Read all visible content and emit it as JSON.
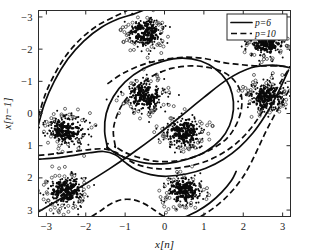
{
  "figure": {
    "background": "#ffffff",
    "point_color": "#0a0a0a",
    "line_color": "#0d0d0d"
  },
  "axes": {
    "xlabel": "x[n]",
    "ylabel": "x[n−1]",
    "xlim": [
      -3.2,
      3.2
    ],
    "ylim": [
      -3.2,
      3.2
    ],
    "xticks": [
      -3,
      -2,
      -1,
      0,
      1,
      2,
      3
    ],
    "yticks": [
      -3,
      -2,
      -1,
      0,
      1,
      2,
      3
    ],
    "xtick_labels": [
      "−3",
      "−2",
      "−1",
      "0",
      "1",
      "2",
      "3"
    ],
    "ytick_labels": [
      "3",
      "2",
      "1",
      "0",
      "−1",
      "−2",
      "−3"
    ],
    "grid": false,
    "box": true
  },
  "legend": {
    "position": "top-right",
    "entries": [
      {
        "label": "p=6",
        "style": "solid"
      },
      {
        "label": "p=10",
        "style": "dashed"
      }
    ]
  },
  "chart_data": {
    "type": "scatter",
    "title": "",
    "xlabel": "x[n]",
    "ylabel": "x[n−1]",
    "xlim": [
      -3.2,
      3.2
    ],
    "ylim": [
      -3.2,
      3.2
    ],
    "grid": false,
    "legend_position": "top-right",
    "marker": "filled-dot",
    "cluster_spread": 0.22,
    "points_per_cluster": 260,
    "clusters": [
      {
        "name": "cluster-left-mid",
        "center": [
          -2.5,
          -0.5
        ],
        "spread": 0.23
      },
      {
        "name": "cluster-top-center",
        "center": [
          -0.5,
          2.5
        ],
        "spread": 0.22
      },
      {
        "name": "cluster-top-right",
        "center": [
          2.6,
          2.2
        ],
        "spread": 0.22
      },
      {
        "name": "cluster-center-left",
        "center": [
          -0.5,
          0.55
        ],
        "spread": 0.24
      },
      {
        "name": "cluster-center-low",
        "center": [
          0.5,
          -0.6
        ],
        "spread": 0.24
      },
      {
        "name": "cluster-right-mid",
        "center": [
          2.6,
          0.5
        ],
        "spread": 0.23
      },
      {
        "name": "cluster-bottom-left",
        "center": [
          -2.5,
          -2.4
        ],
        "spread": 0.24
      },
      {
        "name": "cluster-bottom-mid",
        "center": [
          0.5,
          -2.4
        ],
        "spread": 0.22
      }
    ],
    "series": [
      {
        "name": "p=6",
        "style": "solid",
        "type": "contour",
        "curves": [
          {
            "name": "outer-arc-upper-left",
            "points": [
              [
                -3.2,
                -0.35
              ],
              [
                -3.05,
                0.3
              ],
              [
                -2.8,
                1.0
              ],
              [
                -2.45,
                1.7
              ],
              [
                -2.05,
                2.25
              ],
              [
                -1.6,
                2.68
              ],
              [
                -1.15,
                2.95
              ],
              [
                -0.8,
                3.08
              ],
              [
                -0.55,
                3.2
              ]
            ]
          },
          {
            "name": "inner-closed-loop",
            "points": [
              [
                -1.45,
                -1.05
              ],
              [
                -1.52,
                -0.55
              ],
              [
                -1.48,
                0.0
              ],
              [
                -1.3,
                0.52
              ],
              [
                -1.0,
                0.98
              ],
              [
                -0.55,
                1.38
              ],
              [
                -0.05,
                1.62
              ],
              [
                0.45,
                1.72
              ],
              [
                0.92,
                1.63
              ],
              [
                1.3,
                1.38
              ],
              [
                1.58,
                1.02
              ],
              [
                1.72,
                0.6
              ],
              [
                1.75,
                0.12
              ],
              [
                1.65,
                -0.38
              ],
              [
                1.42,
                -0.82
              ],
              [
                1.05,
                -1.18
              ],
              [
                0.58,
                -1.42
              ],
              [
                0.08,
                -1.55
              ],
              [
                -0.42,
                -1.55
              ],
              [
                -0.88,
                -1.42
              ],
              [
                -1.22,
                -1.25
              ],
              [
                -1.45,
                -1.05
              ]
            ]
          },
          {
            "name": "diagonal-line",
            "points": [
              [
                -3.2,
                -3.05
              ],
              [
                -2.6,
                -2.62
              ],
              [
                -2.0,
                -2.18
              ],
              [
                -1.4,
                -1.72
              ],
              [
                -0.8,
                -1.22
              ],
              [
                -0.2,
                -0.68
              ],
              [
                0.4,
                -0.1
              ],
              [
                1.0,
                0.5
              ],
              [
                1.6,
                1.06
              ],
              [
                2.2,
                1.42
              ],
              [
                2.75,
                1.5
              ],
              [
                3.2,
                1.42
              ]
            ]
          },
          {
            "name": "lower-wave",
            "points": [
              [
                -3.2,
                -1.42
              ],
              [
                -2.75,
                -1.38
              ],
              [
                -2.3,
                -1.3
              ],
              [
                -1.9,
                -1.22
              ],
              [
                -1.55,
                -1.18
              ],
              [
                -1.25,
                -1.28
              ],
              [
                -1.0,
                -1.52
              ],
              [
                -0.72,
                -1.75
              ],
              [
                -0.35,
                -1.9
              ],
              [
                0.05,
                -1.95
              ],
              [
                0.55,
                -1.88
              ],
              [
                1.05,
                -1.7
              ],
              [
                1.5,
                -1.42
              ],
              [
                1.9,
                -1.05
              ],
              [
                2.25,
                -0.6
              ],
              [
                2.55,
                -0.08
              ],
              [
                2.8,
                0.45
              ],
              [
                3.0,
                0.95
              ],
              [
                3.15,
                1.35
              ]
            ]
          },
          {
            "name": "bottom-right-tail",
            "points": [
              [
                0.55,
                -3.2
              ],
              [
                0.85,
                -3.02
              ],
              [
                1.15,
                -2.78
              ],
              [
                1.45,
                -2.45
              ],
              [
                1.7,
                -2.08
              ],
              [
                1.82,
                -1.8
              ]
            ]
          }
        ]
      },
      {
        "name": "p=10",
        "style": "dashed",
        "type": "contour",
        "curves": [
          {
            "name": "outer-arc-upper-left-d",
            "points": [
              [
                -3.2,
                -0.1
              ],
              [
                -3.05,
                0.52
              ],
              [
                -2.82,
                1.15
              ],
              [
                -2.5,
                1.8
              ],
              [
                -2.1,
                2.35
              ],
              [
                -1.68,
                2.75
              ],
              [
                -1.25,
                3.02
              ],
              [
                -0.95,
                3.2
              ]
            ]
          },
          {
            "name": "inner-closed-loop-d",
            "points": [
              [
                -1.25,
                -1.02
              ],
              [
                -1.3,
                -0.55
              ],
              [
                -1.22,
                -0.1
              ],
              [
                -1.02,
                0.38
              ],
              [
                -0.7,
                0.82
              ],
              [
                -0.28,
                1.18
              ],
              [
                0.18,
                1.4
              ],
              [
                0.68,
                1.48
              ],
              [
                1.15,
                1.42
              ],
              [
                1.55,
                1.25
              ],
              [
                1.82,
                0.95
              ],
              [
                1.95,
                0.58
              ],
              [
                1.95,
                0.12
              ],
              [
                1.82,
                -0.35
              ],
              [
                1.58,
                -0.78
              ],
              [
                1.2,
                -1.1
              ],
              [
                0.75,
                -1.35
              ],
              [
                0.25,
                -1.48
              ],
              [
                -0.25,
                -1.48
              ],
              [
                -0.7,
                -1.35
              ],
              [
                -1.05,
                -1.18
              ],
              [
                -1.25,
                -1.02
              ]
            ]
          },
          {
            "name": "upper-right-dashed-arc",
            "points": [
              [
                -1.45,
                0.92
              ],
              [
                -1.05,
                1.25
              ],
              [
                -0.55,
                1.52
              ],
              [
                0.0,
                1.68
              ],
              [
                0.55,
                1.75
              ],
              [
                1.05,
                1.7
              ],
              [
                1.5,
                1.58
              ],
              [
                1.92,
                1.52
              ],
              [
                2.35,
                1.48
              ],
              [
                2.8,
                1.48
              ],
              [
                3.2,
                1.45
              ]
            ]
          },
          {
            "name": "lower-wave-d",
            "points": [
              [
                -3.2,
                -1.3
              ],
              [
                -2.75,
                -1.25
              ],
              [
                -2.3,
                -1.18
              ],
              [
                -1.9,
                -1.12
              ],
              [
                -1.55,
                -1.1
              ],
              [
                -1.25,
                -1.2
              ],
              [
                -0.98,
                -1.4
              ],
              [
                -0.7,
                -1.58
              ],
              [
                -0.32,
                -1.7
              ],
              [
                0.08,
                -1.72
              ],
              [
                0.55,
                -1.65
              ],
              [
                1.02,
                -1.5
              ],
              [
                1.45,
                -1.25
              ],
              [
                1.85,
                -0.9
              ],
              [
                2.2,
                -0.45
              ],
              [
                2.5,
                0.08
              ],
              [
                2.78,
                0.62
              ],
              [
                3.0,
                1.08
              ],
              [
                3.18,
                1.42
              ]
            ]
          },
          {
            "name": "bottom-hump-dashed",
            "points": [
              [
                -1.85,
                -3.2
              ],
              [
                -1.62,
                -3.02
              ],
              [
                -1.38,
                -2.82
              ],
              [
                -1.1,
                -2.68
              ],
              [
                -0.8,
                -2.68
              ],
              [
                -0.52,
                -2.8
              ],
              [
                -0.28,
                -2.98
              ],
              [
                -0.08,
                -3.15
              ],
              [
                0.0,
                -3.2
              ]
            ]
          },
          {
            "name": "bottom-right-tail-d",
            "points": [
              [
                0.92,
                -3.2
              ],
              [
                1.2,
                -2.98
              ],
              [
                1.5,
                -2.68
              ],
              [
                1.78,
                -2.32
              ],
              [
                2.02,
                -1.92
              ],
              [
                2.22,
                -1.48
              ],
              [
                2.4,
                -1.02
              ],
              [
                2.58,
                -0.55
              ],
              [
                2.78,
                -0.08
              ],
              [
                3.0,
                0.38
              ],
              [
                3.2,
                0.8
              ]
            ]
          }
        ]
      }
    ]
  }
}
